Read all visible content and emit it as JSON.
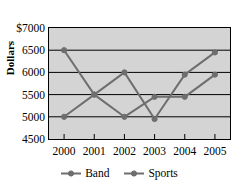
{
  "chart_data": {
    "type": "line",
    "title": "",
    "xlabel": "",
    "ylabel": "Dollars",
    "categories": [
      "2000",
      "2001",
      "2002",
      "2003",
      "2004",
      "2005"
    ],
    "ylim": [
      4500,
      7000
    ],
    "ytick_labels": [
      "$7000",
      "6500",
      "6000",
      "5500",
      "5000",
      "4500"
    ],
    "ytick_values": [
      7000,
      6500,
      6000,
      5500,
      5000,
      4500
    ],
    "grid": true,
    "legend_position": "bottom",
    "series": [
      {
        "name": "Band",
        "color": "#6e6e6e",
        "marker": "circle",
        "values": [
          6500,
          5500,
          5000,
          5450,
          5450,
          5950
        ]
      },
      {
        "name": "Sports",
        "color": "#6e6e6e",
        "marker": "circle",
        "values": [
          5000,
          5500,
          6000,
          4950,
          5950,
          6450
        ]
      }
    ]
  },
  "axis": {
    "y_title": "Dollars"
  },
  "legend": {
    "items": [
      {
        "label": "Band"
      },
      {
        "label": "Sports"
      }
    ]
  },
  "colors": {
    "plot_background": "#d4d4d4",
    "axis": "#000000",
    "gridline": "#000000",
    "series_line": "#6e6e6e",
    "page_background": "#ffffff"
  }
}
